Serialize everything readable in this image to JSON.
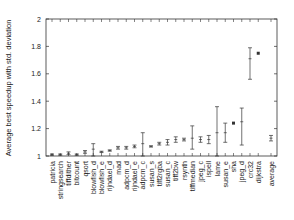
{
  "chart_data": {
    "type": "scatter",
    "title": "",
    "xlabel": "",
    "ylabel": "Average best speedup with std. deviation",
    "ylim": [
      1,
      2
    ],
    "yticks": [
      "1",
      "1.2",
      "1.4",
      "1.6",
      "1.8",
      "2"
    ],
    "grid": false,
    "legend": null,
    "categories": [
      "patricia",
      "stringsearch",
      "tiffdither",
      "bitcount",
      "qsort",
      "blowfish_d",
      "blowfish_e",
      "rijndael_d",
      "mad",
      "adpcm_d",
      "rijndael_e",
      "adpcm_c",
      "susan_s",
      "tiff2rgba",
      "susan_c",
      "tiff2bw",
      "rsynth",
      "tiffmedian",
      "jpeg_c",
      "ispell",
      "lame",
      "susan_e",
      "sha",
      "jpeg_d",
      "crc32",
      "dijkstra",
      "average"
    ],
    "series": [
      {
        "name": "Average best speedup",
        "values": [
          1.01,
          1.01,
          1.02,
          1.01,
          1.03,
          1.05,
          1.03,
          1.04,
          1.06,
          1.06,
          1.07,
          1.09,
          1.07,
          1.09,
          1.1,
          1.12,
          1.12,
          1.13,
          1.12,
          1.12,
          1.17,
          1.17,
          1.24,
          1.25,
          1.71,
          1.75,
          1.13
        ],
        "std_low": [
          1.005,
          1.005,
          1.01,
          1.005,
          1.02,
          1.0,
          1.025,
          1.035,
          1.05,
          1.05,
          1.06,
          1.0,
          1.065,
          1.08,
          1.08,
          1.1,
          1.11,
          1.05,
          1.1,
          1.09,
          1.0,
          1.1,
          1.24,
          1.08,
          1.56,
          1.75,
          1.11
        ],
        "std_high": [
          1.015,
          1.015,
          1.03,
          1.015,
          1.04,
          1.09,
          1.035,
          1.045,
          1.07,
          1.07,
          1.08,
          1.17,
          1.075,
          1.1,
          1.12,
          1.14,
          1.13,
          1.22,
          1.14,
          1.15,
          1.36,
          1.24,
          1.24,
          1.35,
          1.79,
          1.75,
          1.15
        ]
      }
    ]
  }
}
